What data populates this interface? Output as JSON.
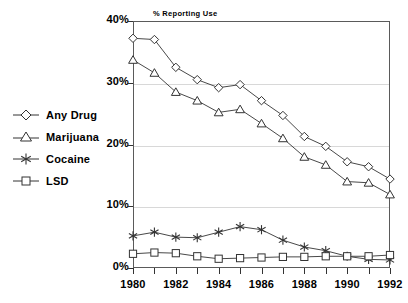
{
  "chart_data": {
    "type": "line",
    "title": "% Reporting Use",
    "xlabel": "",
    "ylabel": "% Reporting Use",
    "x": [
      1980,
      1981,
      1982,
      1983,
      1984,
      1985,
      1986,
      1987,
      1988,
      1989,
      1990,
      1991,
      1992
    ],
    "xtick_labels": [
      "1980",
      "1982",
      "1984",
      "1986",
      "1988",
      "1990",
      "1992"
    ],
    "xtick_values": [
      1980,
      1982,
      1984,
      1986,
      1988,
      1990,
      1992
    ],
    "ytick_labels": [
      "0%",
      "10%",
      "20%",
      "30%",
      "40%"
    ],
    "ytick_values": [
      0,
      10,
      20,
      30,
      40
    ],
    "xlim": [
      1980,
      1992
    ],
    "ylim": [
      0,
      40
    ],
    "grid": true,
    "legend_position": "left-outside",
    "series": [
      {
        "name": "Any Drug",
        "marker": "diamond",
        "values": [
          37.2,
          37.0,
          32.5,
          30.5,
          29.2,
          29.7,
          27.1,
          24.7,
          21.3,
          19.7,
          17.2,
          16.4,
          14.4
        ]
      },
      {
        "name": "Marijuana",
        "marker": "triangle",
        "values": [
          33.7,
          31.6,
          28.5,
          27.1,
          25.2,
          25.7,
          23.4,
          21.0,
          18.0,
          16.7,
          14.0,
          13.8,
          11.9
        ]
      },
      {
        "name": "Cocaine",
        "marker": "asterisk",
        "values": [
          5.2,
          5.8,
          5.0,
          4.9,
          5.8,
          6.7,
          6.2,
          4.5,
          3.4,
          2.8,
          1.9,
          1.4,
          1.3
        ]
      },
      {
        "name": "LSD",
        "marker": "square",
        "values": [
          2.3,
          2.5,
          2.4,
          1.9,
          1.5,
          1.6,
          1.7,
          1.8,
          1.8,
          1.9,
          1.9,
          1.9,
          2.1
        ]
      }
    ]
  },
  "legend": {
    "items": [
      {
        "label": "Any Drug",
        "marker": "diamond"
      },
      {
        "label": "Marijuana",
        "marker": "triangle"
      },
      {
        "label": "Cocaine",
        "marker": "asterisk"
      },
      {
        "label": "LSD",
        "marker": "square"
      }
    ]
  },
  "colors": {
    "line": "#333333",
    "marker_stroke": "#333333",
    "marker_fill": "#ffffff",
    "grid": "#d8d8d8",
    "frame": "#5a5a5a",
    "text": "#000000"
  }
}
